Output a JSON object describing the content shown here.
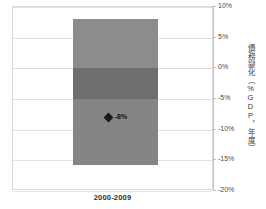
{
  "top_cropped_text": {
    "left": "",
    "right": ""
  },
  "chart_data": {
    "type": "bar",
    "title": "",
    "subtitle": "",
    "xlabel": "",
    "ylabel": "債務變化（%GDP，年度）",
    "categories": [
      "2000-2009"
    ],
    "ylim": [
      -20,
      10
    ],
    "grid": true,
    "legend_position": "none",
    "y_ticks": [
      {
        "value": 10,
        "label": "10%"
      },
      {
        "value": 5,
        "label": "5%"
      },
      {
        "value": 0,
        "label": "0%"
      },
      {
        "value": -5,
        "label": "-5%"
      },
      {
        "value": -10,
        "label": "-10%"
      },
      {
        "value": -15,
        "label": "-15%"
      },
      {
        "value": -20,
        "label": "-20%"
      }
    ],
    "box": {
      "category": "2000-2009",
      "upper_whisker": 8,
      "upper_band_top": 8,
      "upper_band_bottom": 0,
      "middle_band_top": 0,
      "middle_band_bottom": -5,
      "lower_band_top": -5,
      "lower_band_bottom": -15.7,
      "lower_whisker": -15.7,
      "marker_value": -8,
      "marker_label": "-8%",
      "colors": {
        "upper_band": "#8c8c8c",
        "middle_band": "#6e6e6e",
        "lower_band": "#858585",
        "marker": "#1a1a1a"
      }
    },
    "annotations": [
      {
        "text": "-8%",
        "value": -8,
        "category": "2000-2009"
      }
    ],
    "axis_colors": {
      "gridline": "#e2e2e2",
      "axis_line": "#c9c9c9",
      "frame": "#d8d8d8",
      "tick_text": "#4a4a4a"
    }
  }
}
